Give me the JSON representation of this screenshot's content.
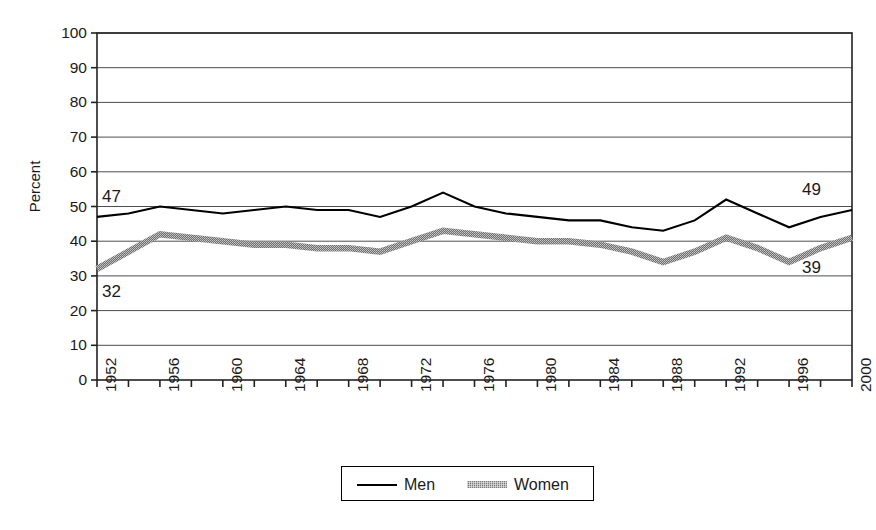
{
  "chart_data": {
    "type": "line",
    "title": "",
    "subtitle": "",
    "xlabel": "",
    "ylabel": "Percent",
    "ylim": [
      0,
      100
    ],
    "xlim": [
      1952,
      2000
    ],
    "grid": true,
    "grid_axis": "y",
    "legend_position": "bottom",
    "y_ticks": [
      0,
      10,
      20,
      30,
      40,
      50,
      60,
      70,
      80,
      90,
      100
    ],
    "y_tick_labels": [
      "0",
      "10",
      "20",
      "30",
      "40",
      "50",
      "60",
      "70",
      "80",
      "90",
      "100"
    ],
    "x_tick_labels": [
      "1952",
      "1956",
      "1960",
      "1964",
      "1968",
      "1972",
      "1976",
      "1980",
      "1984",
      "1988",
      "1992",
      "1996",
      "2000"
    ],
    "x_minor_tick_interval": 2,
    "x": [
      1952,
      1954,
      1956,
      1958,
      1960,
      1962,
      1964,
      1966,
      1968,
      1970,
      1972,
      1974,
      1976,
      1978,
      1980,
      1982,
      1984,
      1986,
      1988,
      1990,
      1992,
      1994,
      1996,
      1998,
      2000
    ],
    "series": [
      {
        "name": "Men",
        "color": "#000000",
        "style": "solid-thin",
        "values": [
          47,
          48,
          50,
          49,
          48,
          49,
          50,
          49,
          49,
          47,
          50,
          54,
          50,
          48,
          47,
          46,
          46,
          44,
          43,
          46,
          52,
          48,
          44,
          47,
          49
        ]
      },
      {
        "name": "Women",
        "color": "#7a7a7a",
        "style": "thick-textured",
        "values": [
          32,
          37,
          42,
          41,
          40,
          39,
          39,
          38,
          38,
          37,
          40,
          43,
          42,
          41,
          40,
          40,
          39,
          37,
          34,
          37,
          41,
          38,
          34,
          38,
          41
        ]
      }
    ],
    "annotations": [
      {
        "text": "47",
        "series": "Men",
        "x": 1952,
        "value": 47,
        "position": "above-left"
      },
      {
        "text": "49",
        "series": "Men",
        "x": 2000,
        "value": 49,
        "position": "above-right"
      },
      {
        "text": "32",
        "series": "Women",
        "x": 1952,
        "value": 32,
        "position": "below-left"
      },
      {
        "text": "39",
        "series": "Women",
        "x": 2000,
        "value": 39,
        "position": "below-right"
      }
    ]
  },
  "legend": {
    "items": [
      {
        "label": "Men"
      },
      {
        "label": "Women"
      }
    ]
  }
}
